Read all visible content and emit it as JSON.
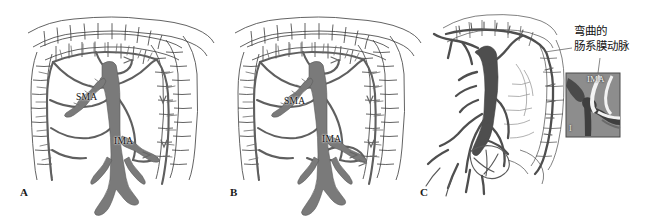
{
  "figure": {
    "kind": "medical-anatomical-illustration",
    "background_color": "#ffffff",
    "panels": [
      {
        "id": "A",
        "label": "A",
        "style": "line-drawing",
        "vessel_labels": [
          {
            "name": "SMA",
            "text": "SMA"
          },
          {
            "name": "IMA",
            "text": "IMA"
          }
        ]
      },
      {
        "id": "B",
        "label": "B",
        "style": "line-drawing",
        "vessel_labels": [
          {
            "name": "SMA",
            "text": "SMA"
          },
          {
            "name": "IMA",
            "text": "IMA"
          }
        ]
      },
      {
        "id": "C",
        "label": "C",
        "style": "angiogram-shaded",
        "vessel_labels": []
      }
    ]
  },
  "annotation": {
    "text": "弯曲的\n肠系膜动脉",
    "line1": "弯曲的",
    "line2": "肠系膜动脉"
  },
  "inset": {
    "label": "IMA",
    "corner_label": "I",
    "border_color": "#4a4a4a",
    "fill_color": "#8d8d8d"
  },
  "colors": {
    "vessel_stroke": "#5f5f5f",
    "vessel_dark": "#6e6e6e",
    "aorta_fill": "#7a7a7a",
    "bowel_stroke": "#3b3b3b",
    "angio_dark": "#4a4a4a",
    "text": "#111111"
  }
}
